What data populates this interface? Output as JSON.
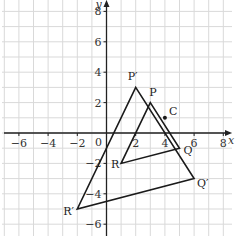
{
  "diagram": {
    "type": "coordinate-grid-enlargement",
    "axes": {
      "x_label": "x",
      "y_label": "y",
      "x_ticks": [
        -6,
        -4,
        -2,
        0,
        2,
        4,
        6,
        8
      ],
      "y_ticks": [
        8,
        6,
        4,
        2,
        -2,
        -4,
        -6
      ],
      "origin_label": "0",
      "x_range": [
        -7,
        8.5
      ],
      "y_range": [
        -7,
        8.7
      ]
    },
    "center": {
      "label": "C",
      "x": 4,
      "y": 1
    },
    "object_triangle": {
      "name": "PQR",
      "points": [
        {
          "label": "P",
          "x": 3,
          "y": 2
        },
        {
          "label": "Q",
          "x": 5,
          "y": -1
        },
        {
          "label": "R",
          "x": 1,
          "y": -2
        }
      ]
    },
    "image_triangle": {
      "name": "P'Q'R'",
      "points": [
        {
          "label": "P′",
          "x": 2,
          "y": 3
        },
        {
          "label": "Q′",
          "x": 6,
          "y": -3
        },
        {
          "label": "R′",
          "x": -2,
          "y": -5
        }
      ]
    },
    "colors": {
      "grid": "#d9d9d9",
      "axis": "#222222",
      "shape": "#1a1a1a",
      "background": "#ffffff"
    }
  }
}
